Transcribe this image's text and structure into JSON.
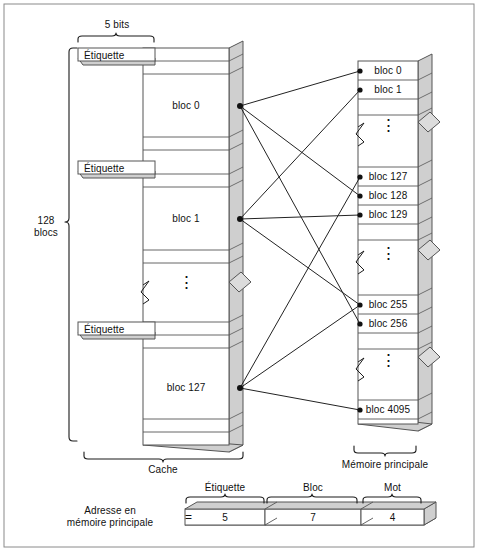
{
  "figure": {
    "title_visible": false,
    "colors": {
      "line": "#1a1a1a",
      "fill_white": "#ffffff",
      "fill_gray": "#cfcfcf",
      "fill_gray_light": "#e0e0e0",
      "border": "#9a9a9a",
      "text": "#111111"
    }
  },
  "cache": {
    "label": "Cache",
    "tag_field": {
      "label": "Étiquette",
      "width_label": "5 bits"
    },
    "size_label_line1": "128",
    "size_label_line2": "blocs",
    "tags": [
      {
        "label": "Étiquette"
      },
      {
        "label": "Étiquette"
      },
      {
        "label": "Étiquette"
      }
    ],
    "blocks": [
      {
        "label": "bloc 0"
      },
      {
        "label": "bloc 1"
      },
      {
        "label": "bloc 127"
      }
    ],
    "ellipsis": "⋮"
  },
  "main_memory": {
    "label": "Mémoire principale",
    "blocks": [
      {
        "label": "bloc 0"
      },
      {
        "label": "bloc 1"
      },
      {
        "label": "bloc 127"
      },
      {
        "label": "bloc 128"
      },
      {
        "label": "bloc 129"
      },
      {
        "label": "bloc 255"
      },
      {
        "label": "bloc 256"
      },
      {
        "label": "bloc 4095"
      }
    ],
    "ellipsis": "⋮"
  },
  "mappings": [
    {
      "from": "bloc 0",
      "to": [
        "bloc 0",
        "bloc 128",
        "bloc 256"
      ]
    },
    {
      "from": "bloc 1",
      "to": [
        "bloc 1",
        "bloc 129",
        "bloc 255"
      ]
    },
    {
      "from": "bloc 127",
      "to": [
        "bloc 127",
        "bloc 255",
        "bloc 4095"
      ]
    }
  ],
  "address_format": {
    "caption_line1": "Adresse en",
    "caption_line2": "mémoire principale",
    "equals": "=",
    "fields": [
      {
        "name": "Étiquette",
        "bits": "5"
      },
      {
        "name": "Bloc",
        "bits": "7"
      },
      {
        "name": "Mot",
        "bits": "4"
      }
    ]
  }
}
